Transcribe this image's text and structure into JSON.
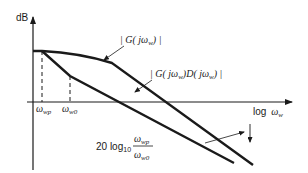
{
  "diagram": {
    "type": "bode-magnitude-sketch",
    "y_axis_label": "dB",
    "x_axis_label_prefix": "log",
    "x_axis_label_var": "ω",
    "x_axis_label_sub": "w",
    "curves": [
      {
        "name": "G",
        "label_parts": [
          "| G( j",
          "ω",
          "w",
          ") |"
        ]
      },
      {
        "name": "GD",
        "label_parts": [
          "| G( j",
          "ω",
          "w",
          ")D( j",
          "ω",
          "w",
          ") |"
        ]
      }
    ],
    "ticks": [
      {
        "var": "ω",
        "sub": "wp"
      },
      {
        "var": "ω",
        "sub": "w0"
      }
    ],
    "annotation": {
      "prefix": "20 log",
      "prefix_sub": "10",
      "numerator_var": "ω",
      "numerator_sub": "wp",
      "denominator_var": "ω",
      "denominator_sub": "w0"
    }
  }
}
